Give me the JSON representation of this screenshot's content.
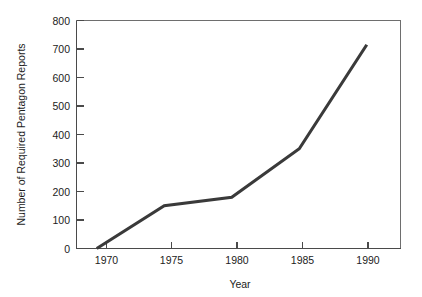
{
  "chart_data": {
    "type": "line",
    "title": "",
    "xlabel": "Year",
    "ylabel": "Number of Required Pentagon Reports",
    "x": [
      1970,
      1975,
      1980,
      1985,
      1990
    ],
    "values": [
      0,
      150,
      180,
      350,
      715
    ],
    "series": [
      {
        "name": "Required Pentagon Reports",
        "x": [
          1970,
          1975,
          1980,
          1985,
          1990
        ],
        "values": [
          0,
          150,
          180,
          350,
          715
        ]
      }
    ],
    "xlim": [
      1968.5,
      1992.5
    ],
    "ylim": [
      0,
      800
    ],
    "xticks": [
      1970,
      1975,
      1980,
      1985,
      1990
    ],
    "xtick_labels": [
      "1970",
      "1975",
      "1980",
      "1985",
      "1990"
    ],
    "yticks": [
      0,
      100,
      200,
      300,
      400,
      500,
      600,
      700,
      800
    ],
    "ytick_labels": [
      "0",
      "100",
      "200",
      "300",
      "400",
      "500",
      "600",
      "700",
      "800"
    ],
    "grid": false,
    "legend": "none",
    "line_color": "#3a3a3a",
    "frame_color": "#6e6e6e",
    "background_color": "#ffffff"
  },
  "axes": {
    "y": {
      "title": "Number of Required Pentagon Reports",
      "labels": [
        "800",
        "700",
        "600",
        "500",
        "400",
        "300",
        "200",
        "100",
        "0"
      ]
    },
    "x": {
      "title": "Year",
      "labels": [
        "1970",
        "1975",
        "1980",
        "1985",
        "1990"
      ]
    }
  }
}
